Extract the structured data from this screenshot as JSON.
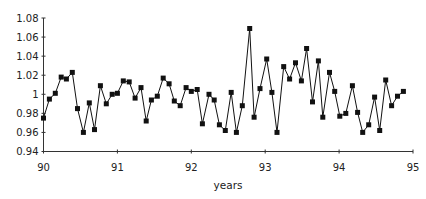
{
  "chart_data": {
    "type": "line",
    "title": "",
    "xlabel": "years",
    "ylabel": "",
    "xlim": [
      90,
      95
    ],
    "ylim": [
      0.94,
      1.08
    ],
    "grid": false,
    "legend": null,
    "marker": "square",
    "x_ticks": [
      90,
      91,
      92,
      93,
      94,
      95
    ],
    "x_tick_labels": [
      "90",
      "91",
      "92",
      "93",
      "94",
      "95"
    ],
    "y_ticks": [
      0.94,
      0.96,
      0.98,
      1.0,
      1.02,
      1.04,
      1.06,
      1.08
    ],
    "y_tick_labels": [
      "0.94",
      "0.96",
      "0.98",
      "1",
      "1.02",
      "1.04",
      "1.06",
      "1.08"
    ],
    "series": [
      {
        "name": "series",
        "x": [
          90.0,
          90.08,
          90.16,
          90.24,
          90.31,
          90.39,
          90.46,
          90.54,
          90.62,
          90.69,
          90.77,
          90.85,
          90.93,
          91.0,
          91.08,
          91.16,
          91.24,
          91.32,
          91.39,
          91.46,
          91.54,
          91.62,
          91.7,
          91.77,
          91.85,
          91.93,
          92.0,
          92.08,
          92.15,
          92.24,
          92.31,
          92.38,
          92.46,
          92.54,
          92.61,
          92.69,
          92.79,
          92.85,
          92.93,
          93.02,
          93.09,
          93.16,
          93.25,
          93.33,
          93.41,
          93.49,
          93.56,
          93.64,
          93.72,
          93.78,
          93.87,
          93.94,
          94.01,
          94.09,
          94.18,
          94.25,
          94.32,
          94.4,
          94.48,
          94.55,
          94.63,
          94.71,
          94.79,
          94.87
        ],
        "values": [
          0.975,
          0.995,
          1.001,
          1.018,
          1.016,
          1.023,
          0.985,
          0.96,
          0.991,
          0.963,
          1.009,
          0.99,
          1.0,
          1.001,
          1.014,
          1.013,
          0.996,
          1.007,
          0.972,
          0.994,
          0.998,
          1.017,
          1.011,
          0.993,
          0.988,
          1.007,
          1.003,
          1.005,
          0.969,
          1.0,
          0.994,
          0.968,
          0.962,
          1.002,
          0.96,
          0.988,
          1.069,
          0.976,
          1.006,
          1.037,
          1.002,
          0.96,
          1.029,
          1.016,
          1.033,
          1.014,
          1.048,
          0.992,
          1.035,
          0.976,
          1.023,
          1.003,
          0.977,
          0.98,
          1.009,
          0.981,
          0.96,
          0.968,
          0.997,
          0.962,
          1.015,
          0.988,
          0.998,
          1.003
        ]
      }
    ]
  }
}
